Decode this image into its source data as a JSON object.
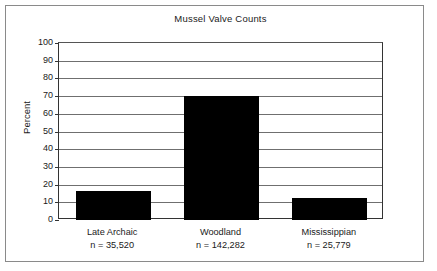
{
  "figure": {
    "title": "Mussel Valve Counts",
    "frame_color": "#8a8a8a",
    "background": "#ffffff"
  },
  "axes": {
    "y_label": "Percent",
    "y_ticks": [
      "100",
      "90",
      "80",
      "70",
      "60",
      "50",
      "40",
      "30",
      "20",
      "10",
      "0"
    ]
  },
  "chart_data": {
    "type": "bar",
    "title": "Mussel Valve Counts",
    "xlabel": "",
    "ylabel": "Percent",
    "ylim": [
      0,
      100
    ],
    "ytick_values": [
      0,
      10,
      20,
      30,
      40,
      50,
      60,
      70,
      80,
      90,
      100
    ],
    "grid": true,
    "legend": false,
    "bar_color": "#000000",
    "categories": [
      "Late Archaic",
      "Woodland",
      "Mississippian"
    ],
    "values": [
      16.5,
      70,
      12.5
    ],
    "sample_sizes": [
      "n = 35,520",
      "n = 142,282",
      "n = 25,779"
    ],
    "bars": [
      {
        "label": "Late Archaic",
        "value": 16.5,
        "n_label": "n = 35,520",
        "n": 35520
      },
      {
        "label": "Woodland",
        "value": 70,
        "n_label": "n = 142,282",
        "n": 142282
      },
      {
        "label": "Mississippian",
        "value": 12.5,
        "n_label": "n = 25,779",
        "n": 25779
      }
    ]
  }
}
